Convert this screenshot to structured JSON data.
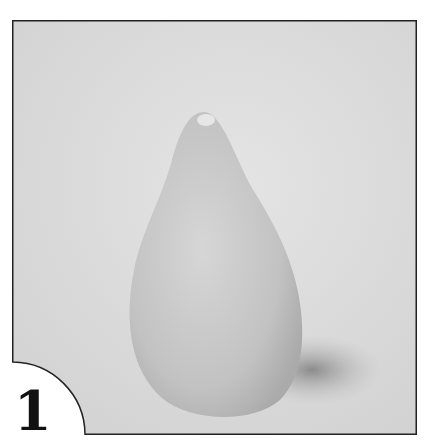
{
  "figure": {
    "number_label": "1",
    "colors": {
      "background": "#d9d9d9",
      "object": "#c8c8c8",
      "frame_border": "#222222",
      "shadow": "#8f8f8f"
    }
  }
}
